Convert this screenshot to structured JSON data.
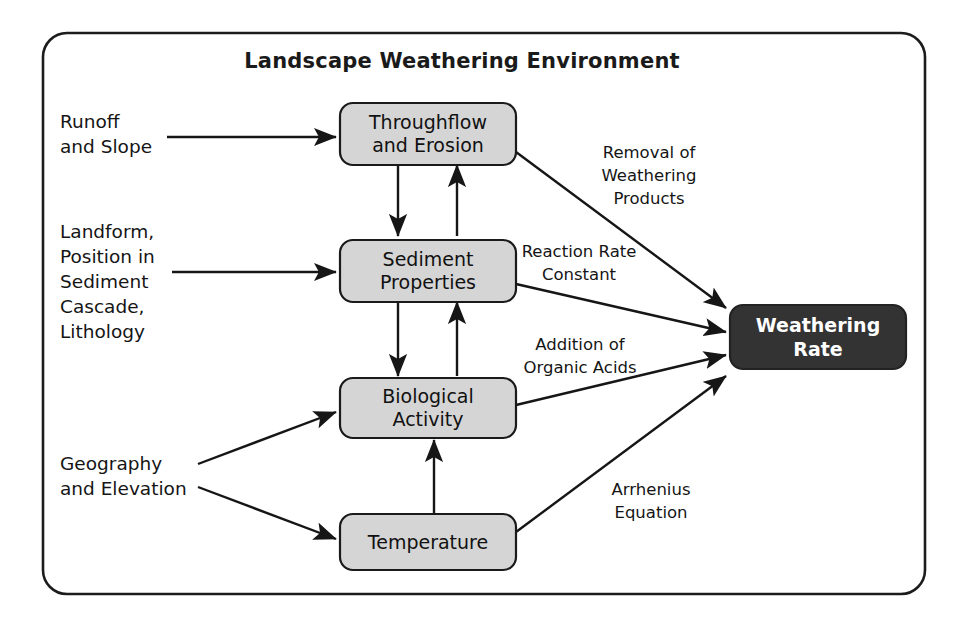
{
  "frame": {
    "title": "Landscape Weathering Environment",
    "border_color": "#1c1c1c"
  },
  "colors": {
    "node_fill": "#d5d5d5",
    "node_stroke": "#1a1a1a",
    "output_fill": "#333333",
    "output_text": "#ffffff",
    "arrow": "#161616",
    "background": "#ffffff"
  },
  "nodes": [
    {
      "id": "throughflow",
      "line1": "Throughflow",
      "line2": "and Erosion",
      "kind": "process"
    },
    {
      "id": "sediment",
      "line1": "Sediment",
      "line2": "Properties",
      "kind": "process"
    },
    {
      "id": "biological",
      "line1": "Biological",
      "line2": "Activity",
      "kind": "process"
    },
    {
      "id": "temperature",
      "line1": "Temperature",
      "line2": "",
      "kind": "process"
    },
    {
      "id": "weathering-rate",
      "line1": "Weathering",
      "line2": "Rate",
      "kind": "output"
    }
  ],
  "inputs": [
    {
      "id": "runoff",
      "lines": [
        "Runoff",
        "and Slope"
      ],
      "target": "throughflow"
    },
    {
      "id": "landform",
      "lines": [
        "Landform,",
        "Position in",
        "Sediment",
        "Cascade,",
        "Lithology"
      ],
      "target": "sediment"
    },
    {
      "id": "geography",
      "lines": [
        "Geography",
        "and Elevation"
      ],
      "target": "biological-and-temperature"
    }
  ],
  "edge_labels": [
    {
      "id": "removal",
      "lines": [
        "Removal of",
        "Weathering",
        "Products"
      ],
      "from": "throughflow",
      "to": "weathering-rate"
    },
    {
      "id": "reaction-rate",
      "lines": [
        "Reaction Rate",
        "Constant"
      ],
      "from": "sediment",
      "to": "weathering-rate"
    },
    {
      "id": "organic-acids",
      "lines": [
        "Addition of",
        "Organic Acids"
      ],
      "from": "biological",
      "to": "weathering-rate"
    },
    {
      "id": "arrhenius",
      "lines": [
        "Arrhenius",
        "Equation"
      ],
      "from": "temperature",
      "to": "weathering-rate"
    }
  ]
}
